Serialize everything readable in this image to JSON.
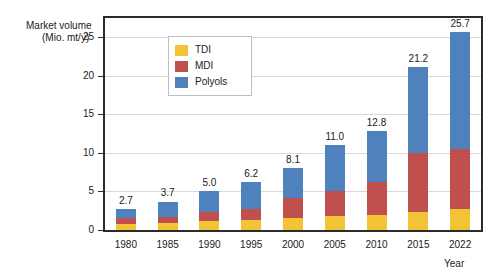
{
  "chart_data": {
    "type": "bar",
    "stacked": true,
    "title": "",
    "subtitle": "",
    "ylabel": "Market volume",
    "ylabel_units": "(Mio. mt/y)",
    "xlabel": "Year",
    "categories": [
      "1980",
      "1985",
      "1990",
      "1995",
      "2000",
      "2005",
      "2010",
      "2015",
      "2022"
    ],
    "series": [
      {
        "name": "TDI",
        "color": "#F2C335",
        "values": [
          0.8,
          0.9,
          1.2,
          1.3,
          1.6,
          1.8,
          2.0,
          2.4,
          2.7
        ]
      },
      {
        "name": "MDI",
        "color": "#C0504D",
        "values": [
          0.7,
          0.8,
          1.1,
          1.4,
          2.5,
          3.2,
          4.2,
          7.6,
          7.8
        ]
      },
      {
        "name": "Polyols",
        "color": "#4F81BD",
        "values": [
          1.2,
          2.0,
          2.7,
          3.5,
          4.0,
          6.0,
          6.6,
          11.2,
          15.2
        ]
      }
    ],
    "totals": [
      "2.7",
      "3.7",
      "5.0",
      "6.2",
      "8.1",
      "11.0",
      "12.8",
      "21.2",
      "25.7"
    ],
    "ylim": [
      0,
      27.5
    ],
    "yticks": [
      0,
      5,
      10,
      15,
      20,
      25
    ],
    "ytick_labels": [
      "0",
      "5",
      "10",
      "15",
      "20",
      "25"
    ],
    "grid": "horizontal",
    "legend_position": "top-left-inside",
    "legend_entries": [
      "TDI",
      "MDI",
      "Polyols"
    ]
  },
  "colors": {
    "tdi": "#F2C335",
    "mdi": "#C0504D",
    "polyols": "#4F81BD",
    "frame": "#2b2b2b",
    "grid": "#d9d9d9",
    "text": "#1a1a1a",
    "background": "#ffffff"
  }
}
